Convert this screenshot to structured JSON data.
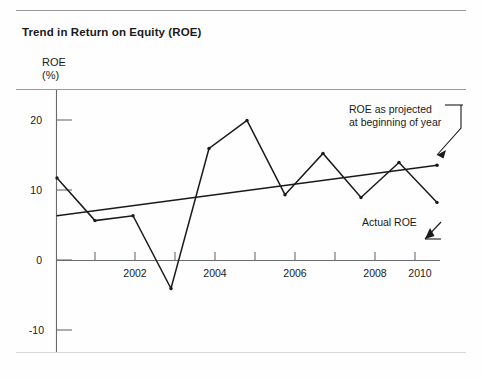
{
  "figure": {
    "title": "Trend in Return on Equity (ROE)",
    "y_axis_caption": "ROE\n(%)"
  },
  "annotations": {
    "projected": "ROE as projected\nat beginning of year",
    "actual": "Actual  ROE"
  },
  "chart_data": {
    "type": "line",
    "title": "Trend in Return on Equity (ROE)",
    "xlabel": "",
    "ylabel": "ROE (%)",
    "xlim": [
      2000,
      2010.6
    ],
    "ylim": [
      -14,
      23
    ],
    "grid": false,
    "legend": "annotations",
    "x": [
      2000,
      2001,
      2002,
      2003,
      2004,
      2005,
      2006,
      2007,
      2008,
      2009,
      2010
    ],
    "xticks": [
      2000,
      2001,
      2002,
      2003,
      2004,
      2005,
      2006,
      2007,
      2008,
      2009,
      2010
    ],
    "xticklabels": [
      "",
      "",
      "2002",
      "",
      "2004",
      "",
      "2006",
      "",
      "2008",
      "",
      "2010"
    ],
    "yticks": [
      -10,
      0,
      10,
      20
    ],
    "yticklabels": [
      "-10",
      "0",
      "10",
      "20"
    ],
    "series": [
      {
        "name": "Actual  ROE",
        "values": [
          11.8,
          5.7,
          6.4,
          -4.0,
          16.0,
          20.0,
          9.4,
          15.3,
          9.0,
          14.0,
          8.3
        ]
      },
      {
        "name": "ROE as projected at beginning of year",
        "type": "trend",
        "x": [
          2000,
          2010
        ],
        "values": [
          6.4,
          13.6
        ]
      }
    ]
  }
}
